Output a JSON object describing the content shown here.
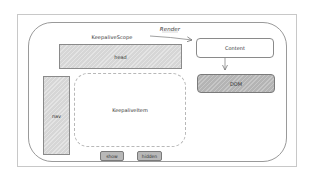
{
  "diagram": {
    "style": "hand-drawn sketch",
    "colors": {
      "outline": "#8a8a8a",
      "fill_light": "#d6d6d6",
      "fill_dark": "#b4b4b4",
      "dashed": "#b8b8b8",
      "text": "#333333"
    },
    "scope_label": "KeepaliveScope",
    "render_label": "Render",
    "nodes": {
      "head": "head",
      "content": "Content",
      "dom": "DOM",
      "nav": "nav",
      "keepalive_item": "KeepaliveItem"
    },
    "buttons": {
      "show": "show",
      "hidden": "hidden"
    },
    "edges": [
      {
        "from": "KeepaliveScope",
        "to": "Content",
        "label": "Render"
      },
      {
        "from": "Content",
        "to": "DOM",
        "label": ""
      }
    ]
  }
}
